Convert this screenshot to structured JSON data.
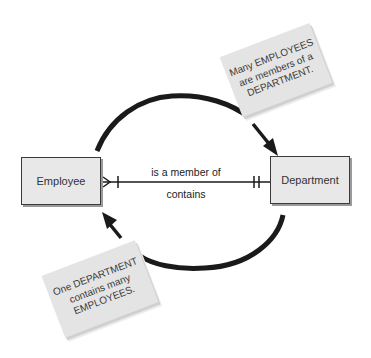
{
  "diagram": {
    "type": "entity-relationship",
    "entities": [
      {
        "id": "employee",
        "label": "Employee"
      },
      {
        "id": "department",
        "label": "Department"
      }
    ],
    "relationship": {
      "forward_label": "is a member of",
      "reverse_label": "contains",
      "employee_end_cardinality": "one-or-many",
      "department_end_cardinality": "one-and-only-one"
    },
    "notes": {
      "top": {
        "lines": [
          "Many EMPLOYEES",
          "are members of a",
          "DEPARTMENT."
        ]
      },
      "bottom": {
        "lines": [
          "One DEPARTMENT",
          "contains many",
          "EMPLOYEES."
        ]
      }
    },
    "colors": {
      "background": "#ffffff",
      "entity_fill": "#e8e8e8",
      "entity_border": "#3a3a3a",
      "note_fill": "#e4e4e4",
      "arrow": "#1a1a1a"
    }
  }
}
